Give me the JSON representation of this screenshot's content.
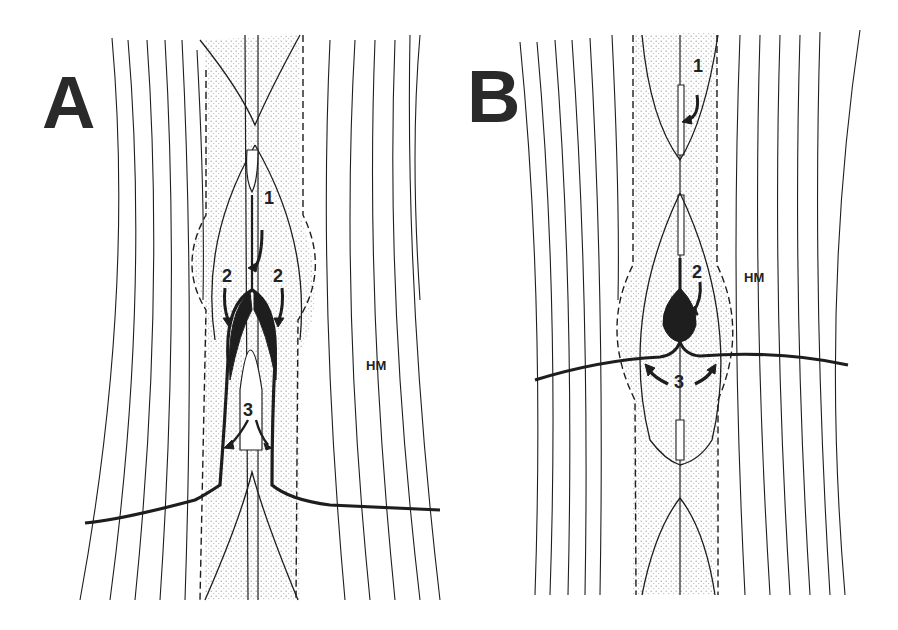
{
  "figure": {
    "panels": [
      {
        "label": "A",
        "tissue_label": "HM",
        "arrow_labels": [
          "1",
          "2",
          "2",
          "3"
        ]
      },
      {
        "label": "B",
        "tissue_label": "HM",
        "arrow_labels": [
          "1",
          "2",
          "3"
        ]
      }
    ],
    "colors": {
      "ink": "#1e1e1e",
      "stipple": "#c8c8c8",
      "background": "#ffffff"
    }
  }
}
